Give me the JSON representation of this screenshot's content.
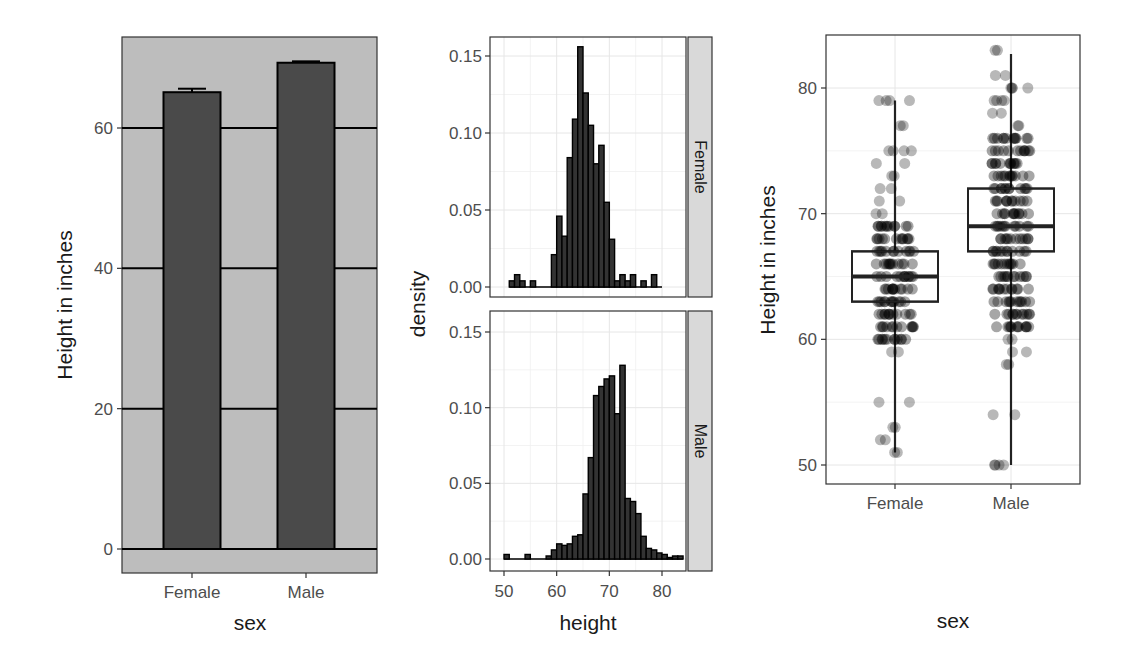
{
  "chart_data": [
    {
      "type": "bar",
      "title": "",
      "xlabel": "sex",
      "ylabel": "Height in inches",
      "categories": [
        "Female",
        "Male"
      ],
      "values": [
        65.1,
        69.3
      ],
      "error_bar_upper": [
        65.6,
        69.5
      ],
      "yticks": [
        0,
        20,
        40,
        60
      ],
      "ytick_labels": [
        "0",
        "20",
        "40",
        "60"
      ],
      "ylim": [
        -3.5,
        73
      ],
      "grid": true,
      "panel_background": "#bdbdbd",
      "bar_fill": "#4a4a4a",
      "gridline_color": "#000000"
    },
    {
      "type": "bar",
      "subtype": "histogram_faceted",
      "xlabel": "height",
      "ylabel": "density",
      "xticks": [
        50,
        60,
        70,
        80
      ],
      "xtick_labels": [
        "50",
        "60",
        "70",
        "80"
      ],
      "yticks": [
        0,
        0.05,
        0.1,
        0.15
      ],
      "ytick_labels": [
        "0.00",
        "0.05",
        "0.10",
        "0.15"
      ],
      "ylim": [
        0,
        0.16
      ],
      "xlim": [
        49,
        85
      ],
      "binwidth": 1,
      "grid": true,
      "facets": [
        {
          "strip_label": "Female",
          "bins_start": [
            51,
            52,
            53,
            54,
            55,
            56,
            57,
            58,
            59,
            60,
            61,
            62,
            63,
            64,
            65,
            66,
            67,
            68,
            69,
            70,
            71,
            72,
            73,
            74,
            75,
            76,
            77,
            78,
            79
          ],
          "density": [
            0.004,
            0.008,
            0.004,
            0.0,
            0.004,
            0.0,
            0.0,
            0.0,
            0.021,
            0.046,
            0.033,
            0.084,
            0.109,
            0.156,
            0.126,
            0.105,
            0.08,
            0.092,
            0.055,
            0.031,
            0.004,
            0.008,
            0.004,
            0.008,
            0.0,
            0.004,
            0.0,
            0.008,
            0.0
          ]
        },
        {
          "strip_label": "Male",
          "bins_start": [
            50,
            51,
            52,
            53,
            54,
            55,
            56,
            57,
            58,
            59,
            60,
            61,
            62,
            63,
            64,
            65,
            66,
            67,
            68,
            69,
            70,
            71,
            72,
            73,
            74,
            75,
            76,
            77,
            78,
            79,
            80,
            81,
            82,
            83
          ],
          "density": [
            0.003,
            0.0,
            0.0,
            0.0,
            0.003,
            0.0,
            0.0,
            0.0,
            0.002,
            0.006,
            0.01,
            0.009,
            0.01,
            0.015,
            0.016,
            0.043,
            0.067,
            0.108,
            0.114,
            0.119,
            0.121,
            0.096,
            0.128,
            0.04,
            0.038,
            0.03,
            0.015,
            0.007,
            0.006,
            0.004,
            0.003,
            0.001,
            0.002,
            0.002
          ]
        }
      ]
    },
    {
      "type": "boxplot",
      "subtype": "boxplot_with_jitter",
      "xlabel": "sex",
      "ylabel": "Height in inches",
      "categories": [
        "Female",
        "Male"
      ],
      "yticks": [
        50,
        60,
        70,
        80
      ],
      "ytick_labels": [
        "50",
        "60",
        "70",
        "80"
      ],
      "ylim": [
        49.2,
        84
      ],
      "grid": true,
      "boxes": [
        {
          "name": "Female",
          "min": 51,
          "q1": 63,
          "median": 65,
          "q3": 67,
          "max": 79
        },
        {
          "name": "Male",
          "min": 50,
          "q1": 67,
          "median": 69,
          "q3": 72,
          "max": 82.7
        }
      ],
      "points": {
        "Female": [
          51,
          52,
          53,
          55,
          59,
          60,
          61,
          62,
          63,
          64,
          65,
          66,
          67,
          68,
          69,
          70,
          71,
          72,
          73,
          74,
          75,
          75,
          77,
          79,
          79
        ],
        "Male": [
          50,
          50,
          54,
          58,
          59,
          60,
          61,
          62,
          63,
          64,
          65,
          66,
          67,
          68,
          69,
          70,
          71,
          72,
          73,
          74,
          75,
          76,
          77,
          78,
          79,
          79,
          80,
          80,
          81,
          83
        ]
      }
    }
  ],
  "labels": {
    "p1_xlabel": "sex",
    "p1_ylabel": "Height in inches",
    "p2_xlabel": "height",
    "p2_ylabel": "density",
    "p2_strip_top": "Female",
    "p2_strip_bottom": "Male",
    "p3_xlabel": "sex",
    "p3_ylabel": "Height in inches"
  }
}
